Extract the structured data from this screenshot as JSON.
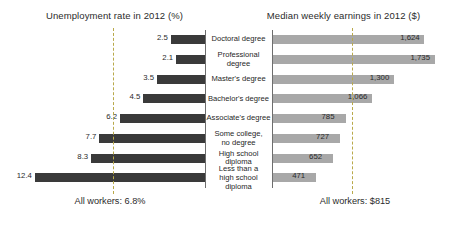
{
  "left_panel": {
    "title": "Unemployment rate in 2012 (%)",
    "footer": "All workers: 6.8%"
  },
  "right_panel": {
    "title": "Median weekly earnings in 2012 ($)",
    "footer": "All workers: $815"
  },
  "colors": {
    "unemployment_bar": "#3a3a3a",
    "earnings_bar": "#a8a8a8",
    "reference_line": "#b9a94a",
    "axis_line": "#6e6e6e",
    "text": "#2b2b2b",
    "background": "#ffffff"
  },
  "rows": [
    {
      "category": "Doctoral degree",
      "category_line1": "Doctoral degree",
      "category_line2": "",
      "unemployment": "2.5",
      "earnings": "1,624"
    },
    {
      "category": "Professional degree",
      "category_line1": "Professional degree",
      "category_line2": "",
      "unemployment": "2.1",
      "earnings": "1,735"
    },
    {
      "category": "Master's degree",
      "category_line1": "Master's degree",
      "category_line2": "",
      "unemployment": "3.5",
      "earnings": "1,300"
    },
    {
      "category": "Bachelor's degree",
      "category_line1": "Bachelor's degree",
      "category_line2": "",
      "unemployment": "4.5",
      "earnings": "1,066"
    },
    {
      "category": "Associate's degree",
      "category_line1": "Associate's degree",
      "category_line2": "",
      "unemployment": "6.2",
      "earnings": "785"
    },
    {
      "category": "Some college, no degree",
      "category_line1": "Some college,",
      "category_line2": "no degree",
      "unemployment": "7.7",
      "earnings": "727"
    },
    {
      "category": "High school diploma",
      "category_line1": "High school diploma",
      "category_line2": "",
      "unemployment": "8.3",
      "earnings": "652"
    },
    {
      "category": "Less than a high school diploma",
      "category_line1": "Less than a",
      "category_line2": "high school diploma",
      "unemployment": "12.4",
      "earnings": "471"
    }
  ],
  "chart_data": {
    "type": "bar",
    "layout": "back-to-back horizontal bar (population pyramid style)",
    "categories": [
      "Doctoral degree",
      "Professional degree",
      "Master's degree",
      "Bachelor's degree",
      "Associate's degree",
      "Some college, no degree",
      "High school diploma",
      "Less than a high school diploma"
    ],
    "series": [
      {
        "name": "Unemployment rate in 2012 (%)",
        "side": "left",
        "direction": "right-to-left",
        "color": "#3a3a3a",
        "unit": "%",
        "values": [
          2.5,
          2.1,
          3.5,
          4.5,
          6.2,
          7.7,
          8.3,
          12.4
        ],
        "value_labels": [
          "2.5",
          "2.1",
          "3.5",
          "4.5",
          "6.2",
          "7.7",
          "8.3",
          "12.4"
        ],
        "axis_range": [
          0,
          14
        ],
        "reference_line": {
          "label": "All workers: 6.8%",
          "value": 6.8
        }
      },
      {
        "name": "Median weekly earnings in 2012 ($)",
        "side": "right",
        "direction": "left-to-right",
        "color": "#a8a8a8",
        "unit": "$",
        "values": [
          1624,
          1735,
          1300,
          1066,
          785,
          727,
          652,
          471
        ],
        "value_labels": [
          "1,624",
          "1,735",
          "1,300",
          "1,066",
          "785",
          "727",
          "652",
          "471"
        ],
        "axis_range": [
          0,
          1900
        ],
        "reference_line": {
          "label": "All workers: $815",
          "value": 815
        }
      }
    ],
    "xlabel": "",
    "ylabel": "",
    "grid": false,
    "legend": "none",
    "annotations": [
      "All workers: 6.8%",
      "All workers: $815"
    ]
  }
}
